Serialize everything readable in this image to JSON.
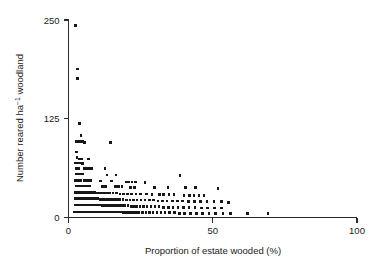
{
  "chart_data": {
    "type": "scatter",
    "title": "",
    "xlabel": "Proportion of estate wooded (%)",
    "ylabel": "Number reared ha⁻¹ woodland",
    "ylabel_parts": {
      "prefix": "Number reared ha",
      "superscript": "−1",
      "suffix": " woodland"
    },
    "xlim": [
      0,
      100
    ],
    "ylim": [
      0,
      250
    ],
    "xticks": [
      0,
      50,
      100
    ],
    "xtick_labels": [
      "0",
      "50",
      "100"
    ],
    "yticks": [
      0,
      125,
      250
    ],
    "ytick_labels": [
      "0",
      "125",
      "250"
    ],
    "grid": false,
    "legend": null,
    "marker": {
      "shape": "square",
      "color": "#171717",
      "size_px": 2.6
    },
    "axes_style": {
      "spines": [
        "left",
        "bottom"
      ],
      "tick_direction": "out"
    },
    "n_points": 251,
    "points": [
      [
        2.4,
        243
      ],
      [
        3.1,
        188
      ],
      [
        3.2,
        176
      ],
      [
        3.8,
        119
      ],
      [
        4.4,
        104
      ],
      [
        2.6,
        96
      ],
      [
        3.3,
        96
      ],
      [
        4.1,
        96
      ],
      [
        4.9,
        96
      ],
      [
        5.6,
        95
      ],
      [
        14.6,
        95
      ],
      [
        2.7,
        83
      ],
      [
        2.9,
        76
      ],
      [
        3.6,
        74
      ],
      [
        4.6,
        74
      ],
      [
        6.9,
        74
      ],
      [
        2.5,
        69
      ],
      [
        3.2,
        69
      ],
      [
        4.0,
        69
      ],
      [
        4.8,
        68
      ],
      [
        2.8,
        62
      ],
      [
        3.5,
        62
      ],
      [
        5.5,
        62
      ],
      [
        6.3,
        62
      ],
      [
        7.1,
        62
      ],
      [
        8.0,
        62
      ],
      [
        12.6,
        62
      ],
      [
        2.6,
        55
      ],
      [
        3.4,
        55
      ],
      [
        4.2,
        55
      ],
      [
        5.0,
        55
      ],
      [
        13.4,
        54
      ],
      [
        16.5,
        54
      ],
      [
        38.6,
        53
      ],
      [
        2.5,
        47
      ],
      [
        3.3,
        47
      ],
      [
        4.1,
        47
      ],
      [
        5.4,
        47
      ],
      [
        6.2,
        47
      ],
      [
        7.0,
        47
      ],
      [
        7.8,
        47
      ],
      [
        11.0,
        46
      ],
      [
        14.8,
        46
      ],
      [
        20.0,
        45
      ],
      [
        21.0,
        45
      ],
      [
        22.0,
        45
      ],
      [
        23.2,
        45
      ],
      [
        26.5,
        44
      ],
      [
        2.7,
        40
      ],
      [
        3.5,
        40
      ],
      [
        4.3,
        40
      ],
      [
        5.1,
        40
      ],
      [
        5.9,
        40
      ],
      [
        6.7,
        40
      ],
      [
        7.5,
        40
      ],
      [
        11.8,
        39
      ],
      [
        12.8,
        39
      ],
      [
        16.2,
        39
      ],
      [
        17.4,
        39
      ],
      [
        18.6,
        39
      ],
      [
        21.5,
        38
      ],
      [
        22.8,
        38
      ],
      [
        29.8,
        38
      ],
      [
        34.5,
        38
      ],
      [
        40.5,
        38
      ],
      [
        44.0,
        38
      ],
      [
        51.8,
        37
      ],
      [
        2.4,
        32
      ],
      [
        3.0,
        32
      ],
      [
        3.6,
        32
      ],
      [
        4.2,
        32
      ],
      [
        4.8,
        32
      ],
      [
        5.4,
        32
      ],
      [
        6.0,
        32
      ],
      [
        6.6,
        32
      ],
      [
        7.2,
        32
      ],
      [
        7.8,
        32
      ],
      [
        8.4,
        32
      ],
      [
        9.0,
        32
      ],
      [
        9.8,
        31
      ],
      [
        10.6,
        31
      ],
      [
        11.4,
        31
      ],
      [
        12.2,
        31
      ],
      [
        13.2,
        31
      ],
      [
        14.2,
        31
      ],
      [
        15.4,
        31
      ],
      [
        16.6,
        31
      ],
      [
        17.8,
        30
      ],
      [
        19.0,
        30
      ],
      [
        20.4,
        30
      ],
      [
        21.8,
        30
      ],
      [
        23.4,
        30
      ],
      [
        25.0,
        30
      ],
      [
        27.0,
        30
      ],
      [
        29.0,
        29
      ],
      [
        31.5,
        29
      ],
      [
        33.0,
        29
      ],
      [
        34.8,
        29
      ],
      [
        36.5,
        29
      ],
      [
        40.0,
        28
      ],
      [
        42.0,
        28
      ],
      [
        43.5,
        28
      ],
      [
        45.2,
        28
      ],
      [
        47.0,
        28
      ],
      [
        2.3,
        24
      ],
      [
        2.9,
        24
      ],
      [
        3.5,
        24
      ],
      [
        4.1,
        24
      ],
      [
        4.7,
        24
      ],
      [
        5.3,
        24
      ],
      [
        5.9,
        24
      ],
      [
        6.5,
        24
      ],
      [
        7.1,
        24
      ],
      [
        7.7,
        24
      ],
      [
        8.3,
        24
      ],
      [
        8.9,
        24
      ],
      [
        9.5,
        24
      ],
      [
        10.1,
        24
      ],
      [
        10.9,
        23
      ],
      [
        11.7,
        23
      ],
      [
        12.5,
        23
      ],
      [
        13.3,
        23
      ],
      [
        14.1,
        23
      ],
      [
        14.9,
        23
      ],
      [
        15.9,
        23
      ],
      [
        16.9,
        23
      ],
      [
        17.9,
        23
      ],
      [
        18.9,
        23
      ],
      [
        20.1,
        22
      ],
      [
        21.3,
        22
      ],
      [
        22.5,
        22
      ],
      [
        23.7,
        22
      ],
      [
        25.1,
        22
      ],
      [
        26.5,
        22
      ],
      [
        28.0,
        22
      ],
      [
        29.5,
        22
      ],
      [
        31.0,
        21
      ],
      [
        32.6,
        21
      ],
      [
        34.2,
        21
      ],
      [
        36.0,
        21
      ],
      [
        37.8,
        21
      ],
      [
        39.6,
        21
      ],
      [
        41.6,
        20
      ],
      [
        43.6,
        20
      ],
      [
        45.8,
        20
      ],
      [
        48.0,
        20
      ],
      [
        50.5,
        20
      ],
      [
        53.0,
        20
      ],
      [
        55.5,
        19
      ],
      [
        2.2,
        16
      ],
      [
        2.8,
        16
      ],
      [
        3.4,
        16
      ],
      [
        4.0,
        16
      ],
      [
        4.6,
        16
      ],
      [
        5.2,
        16
      ],
      [
        5.8,
        16
      ],
      [
        6.4,
        16
      ],
      [
        7.0,
        16
      ],
      [
        7.6,
        16
      ],
      [
        8.2,
        16
      ],
      [
        8.8,
        16
      ],
      [
        9.4,
        16
      ],
      [
        10.0,
        16
      ],
      [
        10.6,
        16
      ],
      [
        11.2,
        16
      ],
      [
        11.8,
        15
      ],
      [
        12.4,
        15
      ],
      [
        13.0,
        15
      ],
      [
        13.6,
        15
      ],
      [
        14.2,
        15
      ],
      [
        14.8,
        15
      ],
      [
        15.6,
        15
      ],
      [
        16.4,
        15
      ],
      [
        17.2,
        15
      ],
      [
        18.0,
        15
      ],
      [
        18.8,
        15
      ],
      [
        19.6,
        15
      ],
      [
        20.6,
        15
      ],
      [
        21.6,
        14
      ],
      [
        22.6,
        14
      ],
      [
        23.6,
        14
      ],
      [
        24.8,
        14
      ],
      [
        26.0,
        14
      ],
      [
        27.2,
        14
      ],
      [
        28.6,
        14
      ],
      [
        30.0,
        14
      ],
      [
        31.4,
        14
      ],
      [
        33.0,
        13
      ],
      [
        34.6,
        13
      ],
      [
        36.2,
        13
      ],
      [
        38.0,
        13
      ],
      [
        39.8,
        13
      ],
      [
        41.8,
        13
      ],
      [
        43.8,
        13
      ],
      [
        46.0,
        12
      ],
      [
        48.2,
        12
      ],
      [
        50.6,
        12
      ],
      [
        53.0,
        12
      ],
      [
        2.1,
        7
      ],
      [
        2.7,
        7
      ],
      [
        3.3,
        7
      ],
      [
        3.9,
        7
      ],
      [
        4.5,
        7
      ],
      [
        5.1,
        7
      ],
      [
        5.7,
        7
      ],
      [
        6.3,
        7
      ],
      [
        6.9,
        7
      ],
      [
        7.5,
        7
      ],
      [
        8.1,
        7
      ],
      [
        8.7,
        7
      ],
      [
        9.3,
        7
      ],
      [
        9.9,
        7
      ],
      [
        10.5,
        7
      ],
      [
        11.1,
        7
      ],
      [
        11.7,
        7
      ],
      [
        12.3,
        7
      ],
      [
        12.9,
        7
      ],
      [
        13.5,
        7
      ],
      [
        14.1,
        7
      ],
      [
        14.9,
        7
      ],
      [
        15.7,
        7
      ],
      [
        16.5,
        7
      ],
      [
        17.3,
        7
      ],
      [
        18.1,
        7
      ],
      [
        18.9,
        6
      ],
      [
        19.7,
        6
      ],
      [
        20.5,
        6
      ],
      [
        21.5,
        6
      ],
      [
        22.5,
        6
      ],
      [
        23.5,
        6
      ],
      [
        24.5,
        6
      ],
      [
        25.7,
        6
      ],
      [
        26.9,
        6
      ],
      [
        28.1,
        6
      ],
      [
        29.3,
        6
      ],
      [
        30.7,
        6
      ],
      [
        32.1,
        6
      ],
      [
        33.5,
        6
      ],
      [
        35.1,
        6
      ],
      [
        36.7,
        6
      ],
      [
        38.5,
        5
      ],
      [
        40.3,
        5
      ],
      [
        42.3,
        5
      ],
      [
        44.3,
        5
      ],
      [
        46.5,
        5
      ],
      [
        48.7,
        5
      ],
      [
        51.0,
        5
      ],
      [
        53.5,
        5
      ],
      [
        56.2,
        5
      ],
      [
        62.0,
        5
      ],
      [
        69.2,
        5
      ]
    ]
  }
}
